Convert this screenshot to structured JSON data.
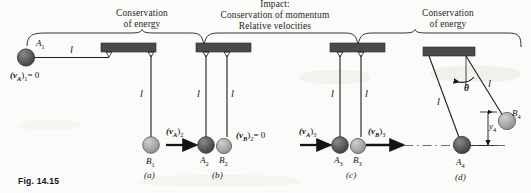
{
  "figure": {
    "number_label": "Fig. 14.15",
    "headings": [
      {
        "id": "h-a",
        "line1": "Conservation",
        "line2": "of energy",
        "line3": ""
      },
      {
        "id": "h-bc",
        "line1": "Impact:",
        "line2": "Conservation of momentum",
        "line3": "Relative velocities"
      },
      {
        "id": "h-d",
        "line1": "Conservation",
        "line2": "of energy",
        "line3": ""
      }
    ],
    "panels": [
      {
        "id": "a",
        "caption": "(a)",
        "labels": {
          "ball_a": "A",
          "ball_a_sub": "1",
          "ball_b": "B",
          "ball_b_sub": "1",
          "velocity_a": "(v",
          "velocity_a_sub_sym": "A",
          "velocity_a_state": ")",
          "velocity_a_state_sub": "1",
          "velocity_a_value": "= 0",
          "cord_h": "l",
          "cord_v": "l"
        }
      },
      {
        "id": "b",
        "caption": "(b)",
        "labels": {
          "ball_a": "A",
          "ball_a_sub": "2",
          "ball_b": "B",
          "ball_b_sub": "2",
          "velocity_a": "(v",
          "velocity_a_sub_sym": "A",
          "velocity_a_state": ")",
          "velocity_a_state_sub": "2",
          "velocity_b": "(v",
          "velocity_b_sub_sym": "B",
          "velocity_b_state": ")",
          "velocity_b_state_sub": "2",
          "velocity_b_value": "= 0",
          "cord_left": "l",
          "cord_right": "l"
        }
      },
      {
        "id": "c",
        "caption": "(c)",
        "labels": {
          "ball_a": "A",
          "ball_a_sub": "3",
          "ball_b": "B",
          "ball_b_sub": "3",
          "velocity_a": "(v",
          "velocity_a_sub_sym": "A",
          "velocity_a_state": ")",
          "velocity_a_state_sub": "3",
          "velocity_b": "(v",
          "velocity_b_sub_sym": "B",
          "velocity_b_state": ")",
          "velocity_b_state_sub": "3",
          "cord_left": "l",
          "cord_right": "l"
        }
      },
      {
        "id": "d",
        "caption": "(d)",
        "labels": {
          "ball_a": "A",
          "ball_a_sub": "4",
          "ball_b": "B",
          "ball_b_sub": "4",
          "angle": "θ",
          "height": "y",
          "height_sub": "4",
          "cord_left": "l",
          "cord_right": "l"
        }
      }
    ],
    "colors": {
      "ball_a_fill": "#575757",
      "ball_b_fill": "#a9a9a9",
      "support_fill": "#4a4a4a",
      "line": "#1d1d1d",
      "paper": "#fbfbf9"
    }
  }
}
